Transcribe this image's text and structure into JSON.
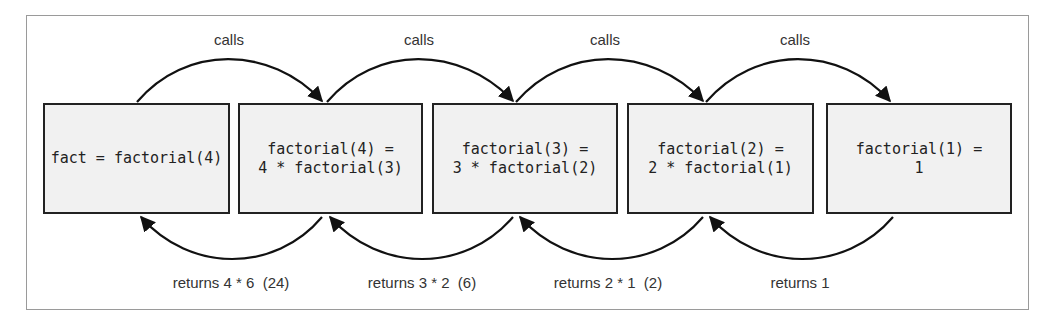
{
  "diagram": {
    "boxes": [
      {
        "id": "box-fact",
        "lines": [
          "fact = factorial(4)"
        ]
      },
      {
        "id": "box-factorial-4",
        "lines": [
          "factorial(4) =",
          "4 * factorial(3)"
        ]
      },
      {
        "id": "box-factorial-3",
        "lines": [
          "factorial(3) =",
          "3 * factorial(2)"
        ]
      },
      {
        "id": "box-factorial-2",
        "lines": [
          "factorial(2) =",
          "2 * factorial(1)"
        ]
      },
      {
        "id": "box-factorial-1",
        "lines": [
          "factorial(1) =",
          "1"
        ]
      }
    ],
    "call_labels": [
      "calls",
      "calls",
      "calls",
      "calls"
    ],
    "return_labels": [
      "returns 4 * 6  (24)",
      "returns 3 * 2  (6)",
      "returns 2 * 1  (2)",
      "returns 1"
    ],
    "colors": {
      "box_fill": "#f1f1f1",
      "stroke": "#222222",
      "frame": "#9a9a9a",
      "label_text": "#333333"
    }
  }
}
